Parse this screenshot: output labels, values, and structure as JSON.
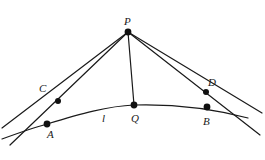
{
  "figure": {
    "type": "geometry-diagram",
    "background_color": "#ffffff",
    "stroke_color": "#1a1a1a",
    "dot_color": "#111111",
    "labels": [
      {
        "id": "P",
        "text": "P",
        "x": 124,
        "y": 16
      },
      {
        "id": "C",
        "text": "C",
        "x": 39,
        "y": 83
      },
      {
        "id": "D",
        "text": "D",
        "x": 208,
        "y": 77
      },
      {
        "id": "A",
        "text": "A",
        "x": 47,
        "y": 129
      },
      {
        "id": "B",
        "text": "B",
        "x": 203,
        "y": 116
      },
      {
        "id": "Q",
        "text": "Q",
        "x": 131,
        "y": 113
      },
      {
        "id": "l",
        "text": "l",
        "x": 102,
        "y": 113
      }
    ],
    "points": [
      {
        "id": "P",
        "cx": 128,
        "cy": 32,
        "r": 3.4
      },
      {
        "id": "C",
        "cx": 58,
        "cy": 101,
        "r": 3.0
      },
      {
        "id": "D",
        "cx": 206,
        "cy": 92,
        "r": 3.0
      },
      {
        "id": "A",
        "cx": 47,
        "cy": 124,
        "r": 3.4
      },
      {
        "id": "B",
        "cx": 207,
        "cy": 107,
        "r": 3.4
      },
      {
        "id": "Q",
        "cx": 134,
        "cy": 105,
        "r": 3.4
      }
    ],
    "curve": {
      "id": "curve-l",
      "path": "M 2 139 C 24 131 36 127 47 124 C 80 114 108 106 134 105 C 168 104 210 108 248 118"
    },
    "segments": [
      {
        "id": "line-P-C-extended",
        "x1": 128,
        "y1": 32,
        "x2": 10,
        "y2": 145
      },
      {
        "id": "line-P-A-extended",
        "x1": 128,
        "y1": 32,
        "x2": 2,
        "y2": 128
      },
      {
        "id": "line-P-Q",
        "x1": 128,
        "y1": 32,
        "x2": 134,
        "y2": 105
      },
      {
        "id": "line-P-D-extended",
        "x1": 128,
        "y1": 32,
        "x2": 260,
        "y2": 135
      },
      {
        "id": "line-P-B-extended",
        "x1": 128,
        "y1": 32,
        "x2": 262,
        "y2": 113
      }
    ]
  }
}
